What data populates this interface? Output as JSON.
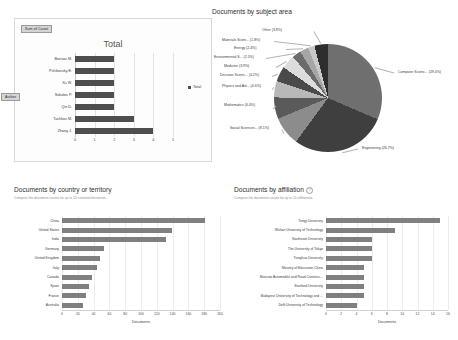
{
  "pivot": {
    "tag_sum": "Sum of Count",
    "tag_field": "Author",
    "title": "Total",
    "legend": "Total",
    "xticks": [
      "0",
      "1",
      "2",
      "3",
      "4",
      "5"
    ],
    "xmax": 5,
    "rows": [
      {
        "label": "Borisov M.",
        "value": 2
      },
      {
        "label": "Pshikovsky E.",
        "value": 2
      },
      {
        "label": "Xu W.",
        "value": 2
      },
      {
        "label": "Sokolov P.",
        "value": 2
      },
      {
        "label": "Qin D.",
        "value": 2
      },
      {
        "label": "Tachkov M.",
        "value": 3
      },
      {
        "label": "Zhang J.",
        "value": 4
      }
    ]
  },
  "subject": {
    "title": "Documents by subject area",
    "chart_data": {
      "type": "pie",
      "title": "Documents by subject area",
      "categories": [
        "Computer Scienc...",
        "Engineering",
        "Social Sciences...",
        "Mathematics",
        "Physics and Ast...",
        "Decision Scienc...",
        "Medicine",
        "Environmental S...",
        "Energy",
        "Materials Scien...",
        "Other"
      ],
      "values": [
        29.4,
        26.7,
        8.1,
        6.0,
        4.6,
        4.2,
        3.9,
        2.5,
        2.4,
        1.8,
        3.8
      ],
      "labels": [
        "Computer Scienc... (29.4%)",
        "Engineering (26.7%)",
        "Social Sciences... (8.1%)",
        "Mathematics (6.0%)",
        "Physics and Ast... (4.6%)",
        "Decision Scienc... (4.2%)",
        "Medicine (3.9%)",
        "Environmental S... (2.5%)",
        "Energy (2.4%)",
        "Materials Scien... (1.8%)",
        "Other (3.8%)"
      ],
      "colors": [
        "#6f6f6f",
        "#3f3f3f",
        "#8c8c8c",
        "#5a5a5a",
        "#b8b8b8",
        "#4a4a4a",
        "#dcdcdc",
        "#6b6b6b",
        "#a6a6a6",
        "#c9c9c9",
        "#2e2e2e"
      ],
      "legend": "none"
    }
  },
  "country": {
    "title": "Documents by country or territory",
    "subtitle": "Compare the document counts for up to 15 countries/territories.",
    "chart_data": {
      "type": "bar",
      "orientation": "horizontal",
      "title": "Documents by country or territory",
      "categories": [
        "China",
        "United States",
        "India",
        "Germany",
        "United Kingdom",
        "Italy",
        "Canada",
        "Spain",
        "France",
        "Australia"
      ],
      "values": [
        181,
        139,
        132,
        53,
        48,
        44,
        38,
        34,
        30,
        26
      ],
      "xlabel": "Documents",
      "ylabel": "",
      "xlim": [
        0,
        200
      ],
      "xticks": [
        "0",
        "20",
        "40",
        "60",
        "80",
        "100",
        "120",
        "140",
        "160",
        "180",
        "200"
      ],
      "grid": true
    }
  },
  "affiliation": {
    "title": "Documents by affiliation",
    "subtitle": "Compare the document counts for up to 15 affiliations.",
    "help_glyph": "?",
    "chart_data": {
      "type": "bar",
      "orientation": "horizontal",
      "title": "Documents by affiliation",
      "categories": [
        "Tongji University",
        "Wuhan University of Technology",
        "Southeast University",
        "The University of Tokyo",
        "Tsinghua University",
        "Ministry of Education China",
        "Moscow Automobile and Road Construc...",
        "Stanford University",
        "Budapest University of Technology and ...",
        "Delft University of Technology"
      ],
      "values": [
        15,
        9,
        6,
        6,
        6,
        5,
        5,
        5,
        5,
        4
      ],
      "xlabel": "Documents",
      "ylabel": "",
      "xlim": [
        0,
        16
      ],
      "xticks": [
        "0",
        "2",
        "4",
        "6",
        "8",
        "10",
        "12",
        "14",
        "16"
      ],
      "grid": true
    }
  }
}
